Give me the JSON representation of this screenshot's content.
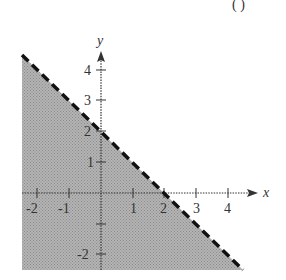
{
  "figure": {
    "header_fragment": "( )",
    "axes": {
      "x_label": "x",
      "y_label": "y",
      "x_ticks": [
        "-2",
        "-1",
        "1",
        "2",
        "3",
        "4"
      ],
      "y_ticks": [
        "4",
        "3",
        "2",
        "1",
        "-2"
      ]
    },
    "boundary_line": {
      "equation": "y = -x + 2",
      "style": "dashed",
      "y_intercept": 2,
      "x_intercept": 2
    },
    "shading": {
      "region": "below line",
      "color": "#a8a8a8"
    }
  }
}
